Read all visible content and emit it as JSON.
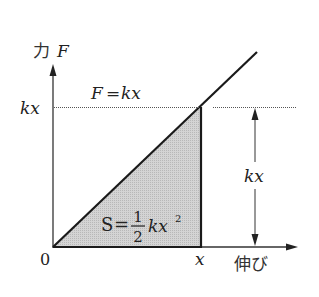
{
  "diagram": {
    "y_axis_label_jp": "力",
    "y_axis_label_var": "F",
    "x_axis_label_jp": "伸び",
    "origin_label": "0",
    "x_tick_label": "x",
    "y_tick_label": "kx",
    "line_equation": "F = kx",
    "line_equation_lhs": "F",
    "line_equation_eq": "=",
    "line_equation_rhs": "kx",
    "area_label_lhs": "S",
    "area_label_eq": "=",
    "area_label_frac_num": "1",
    "area_label_frac_den": "2",
    "area_label_rhs": "kx",
    "area_label_exp": "2",
    "height_dimension_label": "kx",
    "colors": {
      "line": "#1a1a1a",
      "shade": "#c8c8c8",
      "text": "#222222"
    }
  }
}
